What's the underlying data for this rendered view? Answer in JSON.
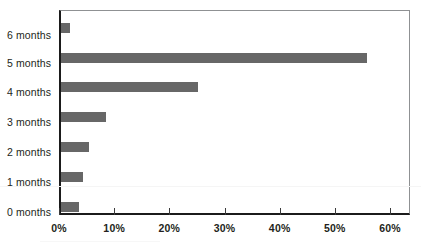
{
  "chart_data": {
    "type": "bar",
    "orientation": "horizontal",
    "title": "",
    "xlabel": "",
    "ylabel": "",
    "categories": [
      "0 months",
      "1 months",
      "2 months",
      "3 months",
      "4 months",
      "5 months",
      "6 months"
    ],
    "values": [
      1.6,
      55.4,
      24.8,
      8.1,
      5.0,
      4.0,
      3.2
    ],
    "value_suffix": "%",
    "xlim": [
      0,
      60
    ],
    "x_ticks": [
      0,
      10,
      20,
      30,
      40,
      50,
      60
    ],
    "x_tick_labels": [
      "0%",
      "10%",
      "20%",
      "30%",
      "40%",
      "50%",
      "60%"
    ],
    "grid": false,
    "legend": false,
    "legend_position": "none",
    "bar_color": "#676767",
    "axis_color": "#1b1b1b",
    "frame_color": "#8f9193",
    "background_color": "#ffffff",
    "text_color": "#231f20"
  },
  "y_axis": {
    "labels": [
      {
        "text": "6 months"
      },
      {
        "text": "5 months"
      },
      {
        "text": "4 months"
      },
      {
        "text": "3 months"
      },
      {
        "text": "2 months"
      },
      {
        "text": "1 months"
      },
      {
        "text": "0 months"
      }
    ]
  },
  "x_axis": {
    "ticks": [
      {
        "label": "0%",
        "value": 0
      },
      {
        "label": "10%",
        "value": 10
      },
      {
        "label": "20%",
        "value": 20
      },
      {
        "label": "30%",
        "value": 30
      },
      {
        "label": "40%",
        "value": 40
      },
      {
        "label": "50%",
        "value": 50
      },
      {
        "label": "60%",
        "value": 60
      }
    ]
  },
  "bars": [
    {
      "category": "6 months",
      "value": 3.2
    },
    {
      "category": "5 months",
      "value": 4.0
    },
    {
      "category": "4 months",
      "value": 5.0
    },
    {
      "category": "3 months",
      "value": 8.1
    },
    {
      "category": "2 months",
      "value": 24.8
    },
    {
      "category": "1 months",
      "value": 55.4
    },
    {
      "category": "0 months",
      "value": 1.6
    }
  ]
}
